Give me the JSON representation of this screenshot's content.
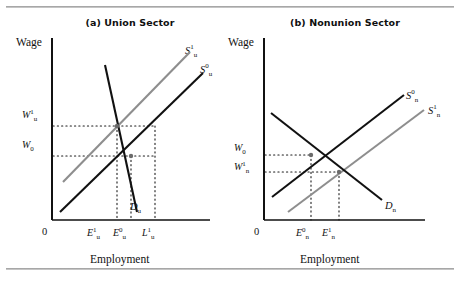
{
  "figure": {
    "background": "#ffffff",
    "rule_color": "#a8a8a8",
    "curve_black": "#111111",
    "curve_gray": "#8e8e8e",
    "axis_color": "#111111"
  },
  "panels": [
    {
      "id": "union",
      "title": "(a) Union Sector",
      "y_axis_label": "Wage",
      "x_axis_label": "Employment",
      "origin_label": "0",
      "wage_ticks": [
        {
          "name": "w-u-1",
          "base": "W",
          "sup": "1",
          "sub": "u"
        },
        {
          "name": "w-0",
          "base": "W",
          "sup": "",
          "sub": "0"
        }
      ],
      "employment_ticks": [
        {
          "name": "e-u-1",
          "base": "E",
          "sup": "1",
          "sub": "u"
        },
        {
          "name": "e-u-0",
          "base": "E",
          "sup": "0",
          "sub": "u"
        },
        {
          "name": "l-u-1",
          "base": "L",
          "sup": "1",
          "sub": "u"
        }
      ],
      "curves": [
        {
          "name": "supply-u-1",
          "base": "S",
          "sup": "1",
          "sub": "u",
          "color": "gray"
        },
        {
          "name": "supply-u-0",
          "base": "S",
          "sup": "0",
          "sub": "u",
          "color": "black"
        },
        {
          "name": "demand-u",
          "base": "D",
          "sup": "",
          "sub": "u",
          "color": "black"
        }
      ]
    },
    {
      "id": "nonunion",
      "title": "(b) Nonunion Sector",
      "y_axis_label": "Wage",
      "x_axis_label": "Employment",
      "origin_label": "0",
      "wage_ticks": [
        {
          "name": "w-0",
          "base": "W",
          "sup": "",
          "sub": "0"
        },
        {
          "name": "w-n-1",
          "base": "W",
          "sup": "1",
          "sub": "n"
        }
      ],
      "employment_ticks": [
        {
          "name": "e-n-0",
          "base": "E",
          "sup": "0",
          "sub": "n"
        },
        {
          "name": "e-n-1",
          "base": "E",
          "sup": "1",
          "sub": "n"
        }
      ],
      "curves": [
        {
          "name": "supply-n-0",
          "base": "S",
          "sup": "0",
          "sub": "n",
          "color": "black"
        },
        {
          "name": "supply-n-1",
          "base": "S",
          "sup": "1",
          "sub": "n",
          "color": "gray"
        },
        {
          "name": "demand-n",
          "base": "D",
          "sup": "",
          "sub": "n",
          "color": "black"
        }
      ]
    }
  ]
}
